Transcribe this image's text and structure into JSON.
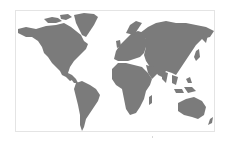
{
  "map": {
    "type": "world-map",
    "projection": "equirectangular-like",
    "land_color": "#7b7b7b",
    "background_color": "#ffffff",
    "border_color": "#e4e4e4",
    "regions": [
      "North America",
      "Greenland",
      "South America",
      "Europe",
      "Africa",
      "Asia",
      "Australia",
      "New Zealand",
      "Japan",
      "Indonesia",
      "United Kingdom",
      "Madagascar"
    ]
  }
}
